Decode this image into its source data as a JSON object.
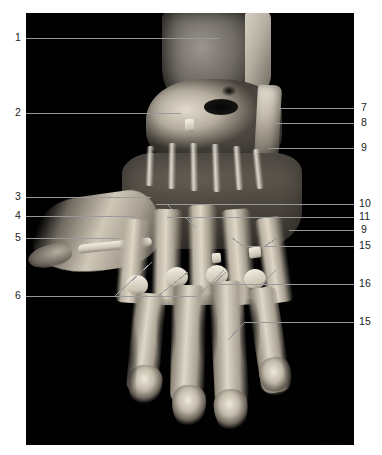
{
  "plate": {
    "kind": "anatomical-photograph",
    "subject": "dorsum-of-hand-dissection",
    "background_color": "#ffffff",
    "photo_background_color": "#010101",
    "leader_line_color": "#9a9a9a",
    "label_text_color": "#1b1b1b"
  },
  "labels": {
    "left": [
      {
        "id": "label-1",
        "text": "1",
        "y": 38,
        "line_to_x": 219,
        "line_y": 38
      },
      {
        "id": "label-2",
        "text": "2",
        "y": 113,
        "line_to_x": 181,
        "line_y": 113
      },
      {
        "id": "label-3",
        "text": "3",
        "y": 197,
        "line_to_x": 151,
        "line_y": 197
      },
      {
        "id": "label-4",
        "text": "4",
        "y": 216,
        "line_to_x": 134,
        "line_y": 216
      },
      {
        "id": "label-5",
        "text": "5",
        "y": 238,
        "line_to_x": 118,
        "line_y": 238
      },
      {
        "id": "label-6",
        "text": "6",
        "y": 296,
        "line_to_x": 198,
        "line_y": 296
      }
    ],
    "right": [
      {
        "id": "label-7",
        "text": "7",
        "y": 108,
        "line_to_x": 277,
        "line_y": 108
      },
      {
        "id": "label-8",
        "text": "8",
        "y": 123,
        "line_to_x": 272,
        "line_y": 123
      },
      {
        "id": "label-9a",
        "text": "9",
        "y": 148,
        "line_to_x": 268,
        "line_y": 148
      },
      {
        "id": "label-10",
        "text": "10",
        "y": 204,
        "line_to_x": 156,
        "line_y": 204
      },
      {
        "id": "label-11",
        "text": "11",
        "y": 217,
        "line_to_x": 167,
        "line_y": 217
      },
      {
        "id": "label-9b",
        "text": "9",
        "y": 230,
        "line_to_x": 289,
        "line_y": 230
      },
      {
        "id": "label-15a",
        "text": "15",
        "y": 246,
        "line_to_x": 243,
        "line_y": 246
      },
      {
        "id": "label-16",
        "text": "16",
        "y": 284,
        "line_to_x": 213,
        "line_y": 284
      },
      {
        "id": "label-15b",
        "text": "15",
        "y": 322,
        "line_to_x": 245,
        "line_y": 322
      }
    ]
  },
  "geometry": {
    "photo_x": 26,
    "photo_y": 13,
    "photo_width": 328,
    "photo_height": 432,
    "canvas_width": 382,
    "canvas_height": 455
  }
}
